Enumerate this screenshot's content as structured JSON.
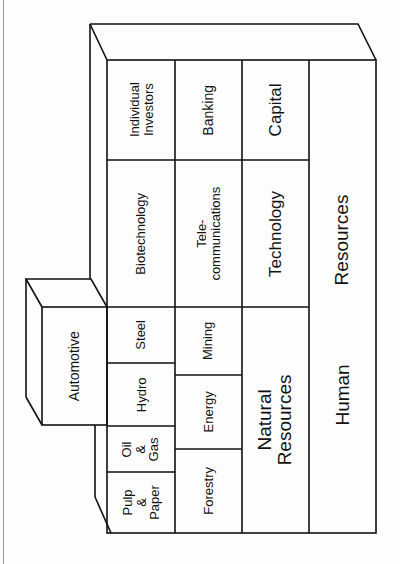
{
  "diagram": {
    "orientation": "rotated 90 degrees counter-clockwise",
    "colors": {
      "line": "#111111",
      "background": "#fdfdfd"
    },
    "top_block": {
      "label": "Automotive"
    },
    "cells": {
      "pulp_paper": "Pulp\n&\nPaper",
      "oil_gas": "Oil\n&\nGas",
      "hydro": "Hydro",
      "steel": "Steel",
      "biotechnology": "Biotechnology",
      "individual_investors": "Individual\nInvestors",
      "forestry": "Forestry",
      "energy": "Energy",
      "mining": "Mining",
      "telecommunications": "Tele-\ncommunications",
      "banking": "Banking",
      "natural_resources": "Natural\nResources",
      "technology": "Technology",
      "capital": "Capital",
      "human_resources_1": "Human",
      "human_resources_2": "Resources"
    },
    "layers": [
      {
        "name": "Row 1 (industries)",
        "items": [
          "Pulp & Paper",
          "Oil & Gas",
          "Hydro",
          "Steel",
          "Biotechnology",
          "Individual Investors"
        ]
      },
      {
        "name": "Row 2 (sectors)",
        "items": [
          "Forestry",
          "Energy",
          "Mining",
          "Telecommunications",
          "Banking"
        ]
      },
      {
        "name": "Row 3 (resources)",
        "items": [
          "Natural Resources",
          "Technology",
          "Capital"
        ]
      },
      {
        "name": "Row 4 (foundation)",
        "items": [
          "Human Resources"
        ]
      }
    ]
  }
}
